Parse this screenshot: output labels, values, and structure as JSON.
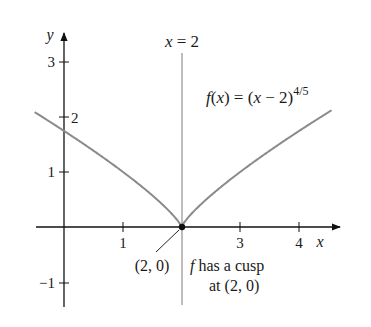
{
  "chart_data": {
    "type": "line",
    "title": "",
    "function_label": "f(x) = (x − 2)",
    "function_exponent": "4/5",
    "xlabel": "x",
    "ylabel": "y",
    "xlim": [
      -0.5,
      4.55
    ],
    "ylim": [
      -1.35,
      3.2
    ],
    "grid": false,
    "x_ticks": [
      {
        "value": 1,
        "label": "1"
      },
      {
        "value": 3,
        "label": "3"
      },
      {
        "value": 4,
        "label": "4"
      }
    ],
    "y_ticks": [
      {
        "value": 3,
        "label": "3"
      },
      {
        "value": 2,
        "label": "2"
      },
      {
        "value": 1,
        "label": "1"
      },
      {
        "value": -1,
        "label": "−1"
      }
    ],
    "series": [
      {
        "name": "f(x) = (x − 2)^(4/5)",
        "color": "#8a8a8a",
        "x": [
          -0.5,
          0,
          0.5,
          1,
          1.5,
          1.9,
          2,
          2.1,
          2.5,
          3,
          3.5,
          4,
          4.5
        ],
        "y": [
          2.08,
          1.74,
          1.38,
          1.0,
          0.57,
          0.16,
          0,
          0.16,
          0.57,
          1.0,
          1.38,
          1.74,
          2.08
        ]
      }
    ],
    "vertical_line": {
      "x": 2,
      "label": "x = 2",
      "color": "#9a9a9a"
    },
    "marked_point": {
      "x": 2,
      "y": 0,
      "label": "(2, 0)"
    },
    "annotation": {
      "line1": "f has a cusp",
      "line1_rest": "has a cusp",
      "line1_f": "f",
      "line2": "at (2, 0)"
    }
  }
}
